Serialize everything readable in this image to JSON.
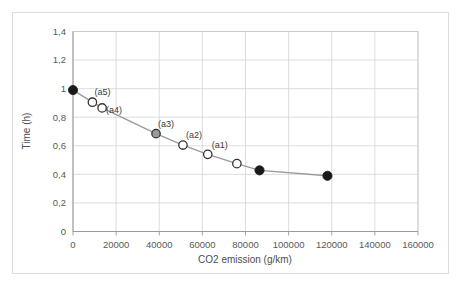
{
  "figure": {
    "background_color": "#ffffff",
    "border_color": "#dcdcdc"
  },
  "chart_data": {
    "type": "line",
    "title": "",
    "subtitle": "",
    "xlabel": "CO2 emission (g/km)",
    "ylabel": "Time (h)",
    "xlim": [
      0,
      160000
    ],
    "ylim": [
      0,
      1.4
    ],
    "grid": true,
    "legend": "none",
    "decimal_separator": ",",
    "xticks": [
      0,
      20000,
      40000,
      60000,
      80000,
      100000,
      120000,
      140000,
      160000
    ],
    "xtick_labels": [
      "0",
      "20000",
      "40000",
      "60000",
      "80000",
      "100000",
      "120000",
      "140000",
      "160000"
    ],
    "yticks": [
      0,
      0.2,
      0.4,
      0.6,
      0.8,
      1.0,
      1.2,
      1.4
    ],
    "ytick_labels": [
      "0",
      "0,2",
      "0,4",
      "0,6",
      "0,8",
      "1",
      "1,2",
      "1,4"
    ],
    "line_color": "#9b9b9b",
    "series": [
      {
        "name": "Pareto front",
        "x": [
          0,
          9000,
          13500,
          38500,
          51000,
          62500,
          76000,
          86500,
          118000
        ],
        "y": [
          0.99,
          0.905,
          0.865,
          0.685,
          0.605,
          0.54,
          0.475,
          0.428,
          0.39
        ],
        "marker_styles": [
          "filled",
          "hollow",
          "hollow",
          "gray",
          "hollow",
          "hollow",
          "hollow",
          "filled",
          "filled"
        ],
        "marker_fill_filled": "#1a1a1a",
        "marker_fill_hollow": "#ffffff",
        "marker_fill_gray": "#9a9a9a",
        "marker_edge": "#333333",
        "labels": [
          "",
          "(a5)",
          "(a4)",
          "(a3)",
          "(a2)",
          "(a1)",
          "",
          "",
          ""
        ]
      }
    ],
    "annotations": [
      {
        "text": "(a5)",
        "x": 9000,
        "y": 0.905
      },
      {
        "text": "(a4)",
        "x": 13500,
        "y": 0.865
      },
      {
        "text": "(a3)",
        "x": 38500,
        "y": 0.685
      },
      {
        "text": "(a2)",
        "x": 51000,
        "y": 0.605
      },
      {
        "text": "(a1)",
        "x": 62500,
        "y": 0.54
      }
    ]
  }
}
